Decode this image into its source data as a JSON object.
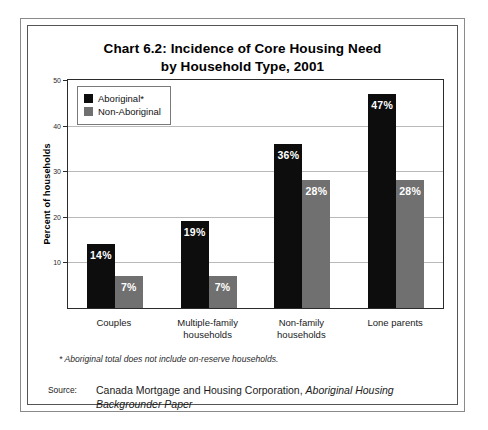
{
  "chart_data": {
    "type": "bar",
    "title": "Chart 6.2: Incidence of Core Housing Need by Household Type, 2001",
    "title_line1": "Chart 6.2: Incidence of Core Housing Need",
    "title_line2": "by Household Type, 2001",
    "xlabel": "",
    "ylabel": "Percent of households",
    "ylim": [
      0,
      50
    ],
    "yticks": [
      10,
      20,
      30,
      40,
      50
    ],
    "ytick_labels": [
      "10",
      "20",
      "30",
      "40",
      "50"
    ],
    "grid": true,
    "legend_position": "top-left-inside",
    "categories": [
      "Couples",
      "Multiple-family households",
      "Non-family households",
      "Lone parents"
    ],
    "category_lines": [
      [
        "Couples"
      ],
      [
        "Multiple-family",
        "households"
      ],
      [
        "Non-family",
        "households"
      ],
      [
        "Lone parents"
      ]
    ],
    "series": [
      {
        "name": "Aboriginal*",
        "color": "#0d0d0d",
        "values": [
          14,
          19,
          36,
          47
        ],
        "data_labels": [
          "14%",
          "19%",
          "36%",
          "47%"
        ]
      },
      {
        "name": "Non-Aboriginal",
        "color": "#707070",
        "values": [
          7,
          7,
          28,
          28
        ],
        "data_labels": [
          "7%",
          "7%",
          "28%",
          "28%"
        ]
      }
    ],
    "footnote": "* Aboriginal total does not include on-reserve households.",
    "source_label": "Source:",
    "source_text_plain": "Canada Mortgage and Housing Corporation, Aboriginal Housing Backgrounder Paper",
    "source_prefix": "Canada Mortgage and Housing Corporation, ",
    "source_publication": "Aboriginal Housing Backgrounder Paper"
  }
}
